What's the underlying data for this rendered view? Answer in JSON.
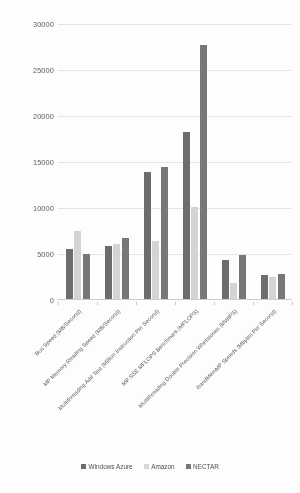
{
  "chart_data": {
    "type": "bar",
    "title": "",
    "subtitle": "",
    "xlabel": "",
    "ylabel": "",
    "grid": true,
    "legend_position": "bottom",
    "ylim": [
      0,
      30000
    ],
    "yticks": [
      0,
      5000,
      10000,
      15000,
      20000,
      25000,
      30000
    ],
    "ytick_labels": [
      "0",
      "5000",
      "10000",
      "15000",
      "20000",
      "25000",
      "30000"
    ],
    "categories": [
      "Bus Speed (MB/Second)",
      "MP Memory Reading Speed (MB/Second)",
      "Multithreading Add Test (Million Instruction Per Second)",
      "MP SSE MFLOPS Benchmark (MFLOPS)",
      "Multithreading Double Precision Whetstones (MWIPS)",
      "RandMemMP Speeds (Mbytes Per Second)"
    ],
    "series": [
      {
        "name": "Windows Azure",
        "color": "#6d6d6d",
        "values": [
          5500,
          5900,
          13900,
          18300,
          4300,
          2700
        ]
      },
      {
        "name": "Amazon",
        "color": "#d4d4d4",
        "values": [
          7500,
          6100,
          6400,
          10100,
          1800,
          2500
        ]
      },
      {
        "name": "NECTAR",
        "color": "#777777",
        "values": [
          5000,
          6700,
          14500,
          27700,
          4900,
          2800
        ]
      }
    ]
  }
}
